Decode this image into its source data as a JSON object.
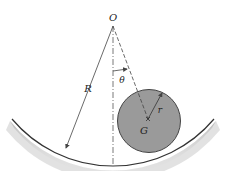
{
  "diagram": {
    "labels": {
      "pivot": "O",
      "path_radius": "R",
      "angle": "θ",
      "cylinder_radius": "r",
      "center_of_mass": "G"
    },
    "colors": {
      "background": "#ffffff",
      "cylinder_fill": "#9a9a9a",
      "cylinder_stroke": "#444444",
      "surface_edge": "#333333",
      "surface_shadow": "#b8b8b8",
      "line": "#444444"
    }
  }
}
